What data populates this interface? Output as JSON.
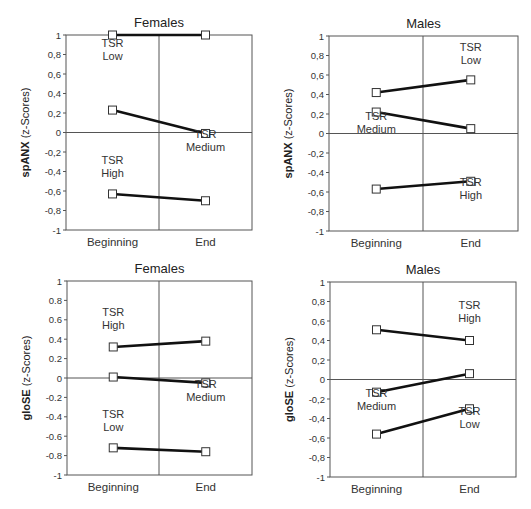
{
  "chart_data": [
    {
      "type": "line",
      "panel": "top-left",
      "title": "Females",
      "ylabel_bold": "spANX",
      "ylabel_rest": "(z-Scores)",
      "decimal_sep": ",",
      "categories": [
        "Beginning",
        "End"
      ],
      "ylim": [
        -1,
        1
      ],
      "yticks": [
        "1",
        "0,8",
        "0,6",
        "0,4",
        "0,2",
        "0",
        "-0,2",
        "-0,4",
        "-0,6",
        "-0,8",
        "-1"
      ],
      "series": [
        {
          "name": "TSR Low",
          "values": [
            1.0,
            1.0
          ]
        },
        {
          "name": "TSR Medium",
          "values": [
            0.23,
            -0.01
          ]
        },
        {
          "name": "TSR High",
          "values": [
            -0.63,
            -0.7
          ]
        }
      ],
      "annotations": [
        {
          "lines": [
            "TSR",
            "Low"
          ],
          "x": 0.0,
          "y": 0.82
        },
        {
          "lines": [
            "TSR",
            "Medium"
          ],
          "x": 1.0,
          "y": -0.12
        },
        {
          "lines": [
            "TSR",
            "High"
          ],
          "x": 0.0,
          "y": -0.38
        }
      ],
      "frame": {
        "left": 66,
        "right": 252,
        "top": 35,
        "bottom": 230,
        "mid": 159
      }
    },
    {
      "type": "line",
      "panel": "top-right",
      "title": "Males",
      "ylabel_bold": "spANX",
      "ylabel_rest": "(z-Scores)",
      "decimal_sep": ",",
      "categories": [
        "Beginning",
        "End"
      ],
      "ylim": [
        -1,
        1
      ],
      "yticks": [
        "1",
        "0,8",
        "0,6",
        "0,4",
        "0,2",
        "0",
        "-0,2",
        "-0,4",
        "-0,6",
        "-0,8",
        "-1"
      ],
      "series": [
        {
          "name": "TSR Low",
          "values": [
            0.42,
            0.55
          ]
        },
        {
          "name": "TSR Medium",
          "values": [
            0.22,
            0.05
          ]
        },
        {
          "name": "TSR High",
          "values": [
            -0.57,
            -0.49
          ]
        }
      ],
      "annotations": [
        {
          "lines": [
            "TSR",
            "Low"
          ],
          "x": 1.0,
          "y": 0.78
        },
        {
          "lines": [
            "TSR",
            "Medium"
          ],
          "x": 0.0,
          "y": 0.08
        },
        {
          "lines": [
            "TSR",
            "High"
          ],
          "x": 1.0,
          "y": -0.6
        }
      ],
      "frame": {
        "left": 329,
        "right": 518,
        "top": 36,
        "bottom": 231,
        "mid": 423
      }
    },
    {
      "type": "line",
      "panel": "bottom-left",
      "title": "Females",
      "ylabel_bold": "gloSE",
      "ylabel_rest": "(z-Scores)",
      "decimal_sep": ".",
      "categories": [
        "Beginning",
        "End"
      ],
      "ylim": [
        -1,
        1
      ],
      "yticks": [
        "1",
        "0.8",
        "0.6",
        "0.4",
        "0.2",
        "0",
        "-0.2",
        "-0.4",
        "-0.6",
        "-0.8",
        "-1"
      ],
      "series": [
        {
          "name": "TSR High",
          "values": [
            0.32,
            0.38
          ]
        },
        {
          "name": "TSR Medium",
          "values": [
            0.01,
            -0.05
          ]
        },
        {
          "name": "TSR Low",
          "values": [
            -0.72,
            -0.76
          ]
        }
      ],
      "annotations": [
        {
          "lines": [
            "TSR",
            "High"
          ],
          "x": 0.0,
          "y": 0.58
        },
        {
          "lines": [
            "TSR",
            "Medium"
          ],
          "x": 1.0,
          "y": -0.17
        },
        {
          "lines": [
            "TSR",
            "Low"
          ],
          "x": 0.0,
          "y": -0.47
        }
      ],
      "frame": {
        "left": 67,
        "right": 252,
        "top": 281,
        "bottom": 475,
        "mid": 159
      }
    },
    {
      "type": "line",
      "panel": "bottom-right",
      "title": "Males",
      "ylabel_bold": "gloSE",
      "ylabel_rest": "(z-Scores)",
      "decimal_sep": ",",
      "categories": [
        "Beginning",
        "End"
      ],
      "ylim": [
        -1,
        1
      ],
      "yticks": [
        "1",
        "0,8",
        "0,6",
        "0,4",
        "0,2",
        "0",
        "-0,2",
        "-0,4",
        "-0,6",
        "-0,8",
        "-1"
      ],
      "series": [
        {
          "name": "TSR High",
          "values": [
            0.51,
            0.4
          ]
        },
        {
          "name": "TSR Medium",
          "values": [
            -0.13,
            0.06
          ]
        },
        {
          "name": "TSR Low",
          "values": [
            -0.56,
            -0.3
          ]
        }
      ],
      "annotations": [
        {
          "lines": [
            "TSR",
            "High"
          ],
          "x": 1.0,
          "y": 0.66
        },
        {
          "lines": [
            "TSR",
            "Medium"
          ],
          "x": 0.0,
          "y": -0.24
        },
        {
          "lines": [
            "TSR",
            "Low"
          ],
          "x": 1.0,
          "y": -0.43
        }
      ],
      "frame": {
        "left": 330,
        "right": 516,
        "top": 282,
        "bottom": 477,
        "mid": 423
      }
    }
  ],
  "style": {
    "line_color": "#111111",
    "frame_color": "#555555",
    "marker_fill": "#ffffff",
    "marker_stroke": "#333333"
  }
}
